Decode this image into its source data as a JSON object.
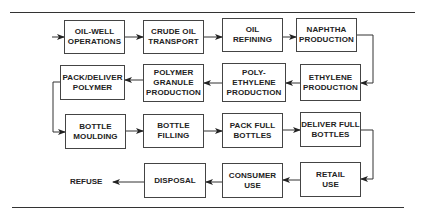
{
  "diagram": {
    "title": "",
    "nodes": [
      {
        "id": "oil-well",
        "label": "OIL-WELL\nOPERATIONS"
      },
      {
        "id": "crude-oil",
        "label": "CRUDE OIL\nTRANSPORT"
      },
      {
        "id": "oil-refining",
        "label": "OIL\nREFINING"
      },
      {
        "id": "naphtha",
        "label": "NAPHTHA\nPRODUCTION"
      },
      {
        "id": "ethylene",
        "label": "ETHYLENE\nPRODUCTION"
      },
      {
        "id": "polyethylene",
        "label": "POLY-\nETHYLENE\nPRODUCTION"
      },
      {
        "id": "polymer-granule",
        "label": "POLYMER\nGRANULE\nPRODUCTION"
      },
      {
        "id": "pack-deliver",
        "label": "PACK/DELIVER\nPOLYMER"
      },
      {
        "id": "bottle-moulding",
        "label": "BOTTLE\nMOULDING"
      },
      {
        "id": "bottle-filling",
        "label": "BOTTLE\nFILLING"
      },
      {
        "id": "pack-full",
        "label": "PACK FULL\nBOTTLES"
      },
      {
        "id": "deliver-full",
        "label": "DELIVER FULL\nBOTTLES"
      },
      {
        "id": "retail-use",
        "label": "RETAIL\nUSE"
      },
      {
        "id": "consumer-use",
        "label": "CONSUMER\nUSE"
      },
      {
        "id": "disposal",
        "label": "DISPOSAL"
      },
      {
        "id": "refuse",
        "label": "REFUSE"
      }
    ],
    "edges": [
      [
        "start",
        "oil-well"
      ],
      [
        "oil-well",
        "crude-oil"
      ],
      [
        "crude-oil",
        "oil-refining"
      ],
      [
        "oil-refining",
        "naphtha"
      ],
      [
        "naphtha",
        "ethylene"
      ],
      [
        "ethylene",
        "polyethylene"
      ],
      [
        "polyethylene",
        "polymer-granule"
      ],
      [
        "polymer-granule",
        "pack-deliver"
      ],
      [
        "pack-deliver",
        "bottle-moulding"
      ],
      [
        "bottle-moulding",
        "bottle-filling"
      ],
      [
        "bottle-filling",
        "pack-full"
      ],
      [
        "pack-full",
        "deliver-full"
      ],
      [
        "deliver-full",
        "retail-use"
      ],
      [
        "retail-use",
        "consumer-use"
      ],
      [
        "consumer-use",
        "disposal"
      ],
      [
        "disposal",
        "refuse"
      ]
    ]
  }
}
